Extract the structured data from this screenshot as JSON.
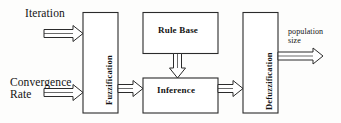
{
  "diagram": {
    "inputs": [
      {
        "id": "iteration",
        "label": "Iteration"
      },
      {
        "id": "convergence",
        "label": "Convergence\nRate"
      }
    ],
    "outputs": [
      {
        "id": "population",
        "label": "population\nsize"
      }
    ],
    "blocks": [
      {
        "id": "fuzzification",
        "label": "Fuzzification",
        "orientation": "vertical"
      },
      {
        "id": "rule-base",
        "label": "Rule Base",
        "orientation": "horizontal"
      },
      {
        "id": "inference",
        "label": "Inference",
        "orientation": "horizontal"
      },
      {
        "id": "defuzzification",
        "label": "Defuzzification",
        "orientation": "vertical"
      }
    ],
    "connections": [
      {
        "id": "iteration-to-fuzzification",
        "from": "iteration",
        "to": "fuzzification",
        "direction": "right"
      },
      {
        "id": "convergence-to-fuzzification",
        "from": "convergence",
        "to": "fuzzification",
        "direction": "right"
      },
      {
        "id": "fuzzification-to-inference",
        "from": "fuzzification",
        "to": "inference",
        "direction": "right"
      },
      {
        "id": "rule-base-to-inference",
        "from": "rule-base",
        "to": "inference",
        "direction": "down"
      },
      {
        "id": "inference-to-defuzzification",
        "from": "inference",
        "to": "defuzzification",
        "direction": "right"
      },
      {
        "id": "defuzzification-to-population",
        "from": "defuzzification",
        "to": "population",
        "direction": "right"
      }
    ],
    "colors": {
      "background": "#fdfdfc",
      "stroke": "#2b2b2b",
      "fill": "#ffffff",
      "text": "#131313"
    }
  }
}
